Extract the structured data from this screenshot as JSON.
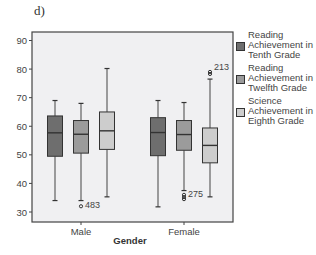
{
  "panel_label": "d)",
  "chart_data": {
    "type": "boxplot",
    "title": "",
    "xlabel": "Gender",
    "ylabel": "",
    "ylim": [
      27,
      95
    ],
    "yticks": [
      30,
      40,
      50,
      60,
      70,
      80,
      90
    ],
    "categories": [
      "Male",
      "Female"
    ],
    "legend_position": "right",
    "grid": false,
    "series": [
      {
        "name": "Reading Achievement in Tenth Grade",
        "color": "#6e6e6e",
        "boxes": [
          {
            "category": "Male",
            "whisker_low": 34,
            "q1": 49.5,
            "median": 57.7,
            "q3": 63.6,
            "whisker_high": 69,
            "outliers": []
          },
          {
            "category": "Female",
            "whisker_low": 31.8,
            "q1": 49.7,
            "median": 57.8,
            "q3": 63,
            "whisker_high": 69,
            "outliers": []
          }
        ]
      },
      {
        "name": "Reading Achievement in Twelfth Grade",
        "color": "#9b9b9b",
        "boxes": [
          {
            "category": "Male",
            "whisker_low": 34,
            "q1": 50.6,
            "median": 57.2,
            "q3": 62,
            "whisker_high": 68,
            "outliers": [
              {
                "value": 32,
                "label": "483"
              }
            ]
          },
          {
            "category": "Female",
            "whisker_low": 37.5,
            "q1": 51.6,
            "median": 57.1,
            "q3": 62,
            "whisker_high": 68.3,
            "outliers": [
              {
                "value": 36,
                "label": "275"
              },
              {
                "value": 35.2,
                "label": ""
              },
              {
                "value": 34.5,
                "label": ""
              }
            ]
          }
        ]
      },
      {
        "name": "Science Achievement in Eighth Grade",
        "color": "#cdcdcd",
        "boxes": [
          {
            "category": "Male",
            "whisker_low": 35.3,
            "q1": 51.9,
            "median": 58.4,
            "q3": 65,
            "whisker_high": 80.2,
            "outliers": []
          },
          {
            "category": "Female",
            "whisker_low": 35.3,
            "q1": 47.2,
            "median": 53.3,
            "q3": 59.4,
            "whisker_high": 76.5,
            "outliers": [
              {
                "value": 79,
                "label": "213"
              },
              {
                "value": 78.3,
                "label": ""
              }
            ]
          }
        ]
      }
    ]
  },
  "legend": {
    "items": [
      {
        "label": "Reading Achievement in Tenth Grade",
        "color": "#6e6e6e"
      },
      {
        "label": "Reading Achievement in Twelfth Grade",
        "color": "#9b9b9b"
      },
      {
        "label": "Science Achievement in Eighth Grade",
        "color": "#cdcdcd"
      }
    ]
  }
}
